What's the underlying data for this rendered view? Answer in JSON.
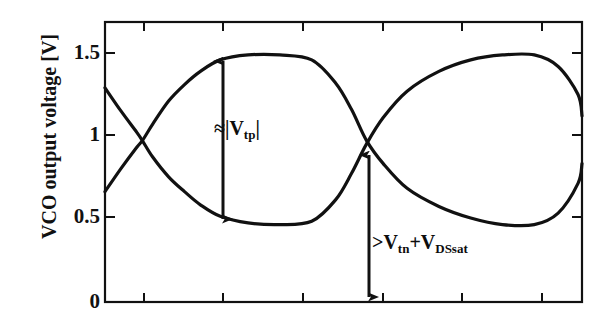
{
  "figure": {
    "width": 599,
    "height": 330,
    "background": "#ffffff",
    "ink_color": "#111111"
  },
  "axis": {
    "y_title": "VCO output voltage [V]",
    "y_ticks": [
      "0",
      "0.5",
      "1",
      "1.5"
    ],
    "y_tick_values": [
      0,
      0.5,
      1,
      1.5
    ],
    "x_ticks": [
      "",
      "",
      "",
      "",
      "",
      ""
    ]
  },
  "annotations": {
    "upper": {
      "prefix": "≈|V",
      "sub": "tp",
      "suffix": "|",
      "full_text": "≈|Vtp|"
    },
    "lower": {
      "prefix": ">V",
      "sub1": "tn",
      "mid": "+V",
      "sub2": "DSsat",
      "full_text": ">Vtn+VDSsat"
    }
  },
  "chart_data": {
    "type": "line",
    "title": "",
    "xlabel": "",
    "ylabel": "VCO output voltage [V]",
    "ylim": [
      0,
      1.7
    ],
    "xlim": [
      0,
      6
    ],
    "grid": false,
    "legend": "none",
    "y_ticks": [
      0,
      0.5,
      1,
      1.5
    ],
    "x_tick_count": 6,
    "x_tick_positions": [
      0.5,
      1.5,
      2.5,
      3.5,
      4.5,
      5.5
    ],
    "series": [
      {
        "name": "VCO output +",
        "color": "#111111",
        "x": [
          0.0,
          0.2,
          0.4,
          0.47,
          0.6,
          0.8,
          1.0,
          1.2,
          1.45,
          1.8,
          2.2,
          2.6,
          2.9,
          3.1,
          3.29,
          3.5,
          3.8,
          4.2,
          4.6,
          5.0,
          5.4,
          5.7,
          5.95,
          6.0
        ],
        "y": [
          1.3,
          1.16,
          1.03,
          0.98,
          0.88,
          0.76,
          0.67,
          0.59,
          0.52,
          0.48,
          0.47,
          0.49,
          0.62,
          0.78,
          0.96,
          1.12,
          1.28,
          1.4,
          1.47,
          1.5,
          1.5,
          1.43,
          1.26,
          1.13
        ]
      },
      {
        "name": "VCO output -",
        "color": "#111111",
        "x": [
          0.0,
          0.2,
          0.4,
          0.47,
          0.6,
          0.8,
          1.0,
          1.2,
          1.45,
          1.8,
          2.2,
          2.6,
          2.9,
          3.1,
          3.29,
          3.5,
          3.8,
          4.2,
          4.6,
          5.0,
          5.4,
          5.7,
          5.95,
          6.0
        ],
        "y": [
          0.67,
          0.81,
          0.94,
          0.98,
          1.08,
          1.22,
          1.32,
          1.4,
          1.47,
          1.5,
          1.5,
          1.47,
          1.33,
          1.17,
          0.98,
          0.84,
          0.69,
          0.58,
          0.51,
          0.47,
          0.47,
          0.54,
          0.72,
          0.84
        ]
      }
    ],
    "markers": [
      {
        "name": "arrow-vtp",
        "type": "double-arrow-vertical",
        "x": 2.2,
        "y_from": 0.47,
        "y_to": 1.5,
        "label": "≈|Vtp|"
      },
      {
        "name": "arrow-vtn",
        "type": "double-arrow-vertical",
        "x": 3.29,
        "y_from": 0.0,
        "y_to": 0.98,
        "label": ">Vtn+VDSsat"
      }
    ]
  }
}
